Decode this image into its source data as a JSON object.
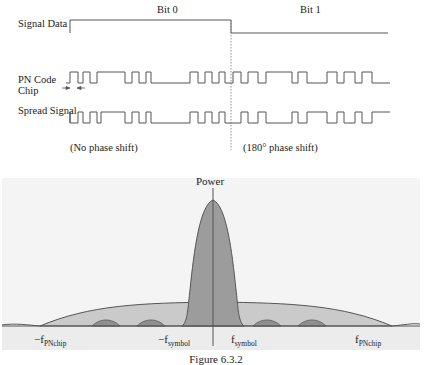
{
  "timing_diagram": {
    "bit_labels": [
      "Bit 0",
      "Bit 1"
    ],
    "rows": [
      {
        "label": "Signal Data"
      },
      {
        "label_line1": "PN Code",
        "label_line2": "Chip"
      },
      {
        "label": "Spread Signal"
      }
    ],
    "annotations": {
      "no_shift": "(No phase shift)",
      "phase_shift": "(180° phase shift)"
    }
  },
  "spectrum": {
    "axis_label": "Power",
    "freq_labels": [
      {
        "main": "−f",
        "sub": "PNchip"
      },
      {
        "main": "−f",
        "sub": "symbol"
      },
      {
        "main": "f",
        "sub": "symbol"
      },
      {
        "main": "f",
        "sub": "PNchip"
      }
    ]
  },
  "caption": "Figure 6.3.2",
  "colors": {
    "line": "#555555",
    "chart_bg": "#f3f3f3",
    "narrow_lobe": "#9a9a9a",
    "wide_lobe": "#c8c8c8",
    "sidelobe": "#8e8e8e"
  }
}
